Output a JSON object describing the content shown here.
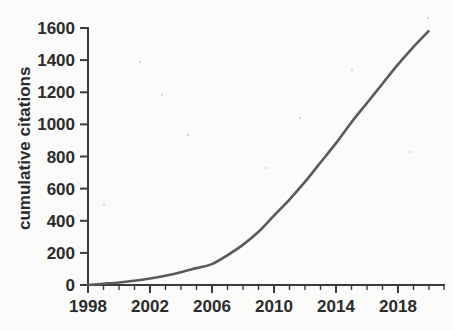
{
  "chart_data": {
    "type": "line",
    "title": "",
    "xlabel": "",
    "ylabel": "cumulative citations",
    "xlim": [
      1998,
      2021
    ],
    "ylim": [
      0,
      1600
    ],
    "grid": false,
    "legend": null,
    "x_tick_labels": [
      "1998",
      "2002",
      "2006",
      "2010",
      "2014",
      "2018"
    ],
    "x_tick_values": [
      1998,
      2002,
      2006,
      2010,
      2014,
      2018
    ],
    "x_minor_tick_interval": 1,
    "y_tick_labels": [
      "0",
      "200",
      "400",
      "600",
      "800",
      "1000",
      "1200",
      "1400",
      "1600"
    ],
    "y_tick_values": [
      0,
      200,
      400,
      600,
      800,
      1000,
      1200,
      1400,
      1600
    ],
    "series": [
      {
        "name": "cumulative citations",
        "color": "#5a5a5a",
        "x": [
          1998,
          1999,
          2000,
          2001,
          2002,
          2003,
          2004,
          2005,
          2006,
          2007,
          2008,
          2009,
          2010,
          2011,
          2012,
          2013,
          2014,
          2015,
          2016,
          2017,
          2018,
          2019,
          2020
        ],
        "values": [
          0,
          8,
          16,
          26,
          40,
          58,
          80,
          105,
          130,
          185,
          250,
          330,
          430,
          530,
          640,
          760,
          880,
          1010,
          1130,
          1250,
          1370,
          1480,
          1580
        ]
      }
    ],
    "line_color": "#5a5a5a",
    "background_color": "#fbfbfa",
    "axis_color": "#3a3a3a"
  },
  "axis": {
    "y_title": "cumulative citations"
  }
}
